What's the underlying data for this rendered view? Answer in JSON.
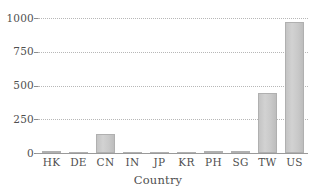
{
  "chart_data": {
    "type": "bar",
    "title": "",
    "xlabel": "Country",
    "ylabel": "",
    "categories": [
      "HK",
      "DE",
      "CN",
      "IN",
      "JP",
      "KR",
      "PH",
      "SG",
      "TW",
      "US"
    ],
    "values": [
      12,
      2,
      140,
      2,
      2,
      2,
      18,
      12,
      444,
      970
    ],
    "ylim": [
      0,
      1000
    ],
    "yticks": [
      0,
      250,
      500,
      750,
      1000
    ],
    "ytick_labels": [
      "0",
      "250",
      "500",
      "750",
      "1000"
    ],
    "grid": "horizontal-dotted",
    "legend": "none",
    "bar_color": "#c9c9c9",
    "bar_edge_color": "#b0b0b0",
    "axis_color": "#9a9a9a",
    "grid_color": "#b7b7b7",
    "text_color": "#4f4f4f",
    "background": "#ffffff"
  }
}
